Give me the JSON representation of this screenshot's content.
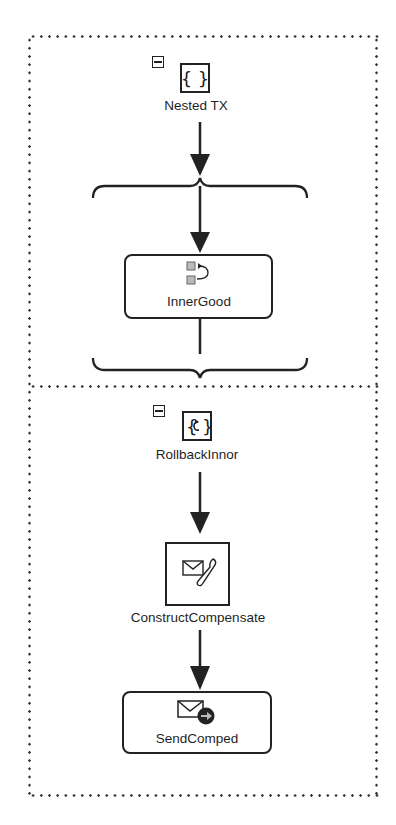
{
  "diagram": {
    "type": "process-flow",
    "outer_scope": {
      "name": "Nested TX",
      "icon": "scope-braces-icon",
      "collapse_state": "expanded"
    },
    "inner_sequence": {
      "activities": [
        {
          "name": "InnerGood",
          "icon": "assign-copy-icon",
          "shape": "rounded-rectangle"
        }
      ]
    },
    "compensation_scope": {
      "name": "RollbackInnor",
      "icon": "compensate-scope-icon",
      "collapse_state": "expanded",
      "activities": [
        {
          "name": "ConstructCompensate",
          "icon": "construct-message-icon",
          "shape": "square"
        },
        {
          "name": "SendComped",
          "icon": "send-message-icon",
          "shape": "rounded-rectangle"
        }
      ]
    },
    "colors": {
      "stroke": "#222222",
      "background": "#ffffff",
      "dotted_border": "#333333"
    }
  }
}
